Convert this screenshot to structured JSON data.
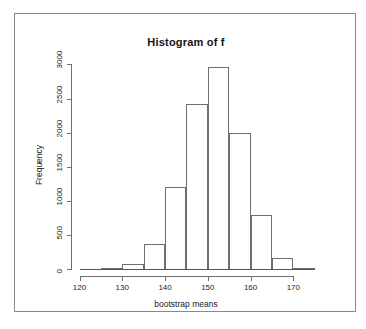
{
  "figure": {
    "title": "Histogram of f",
    "x_axis_title": "bootstrap means",
    "y_axis_title": "Frequency"
  },
  "chart_data": {
    "type": "bar",
    "title": "Histogram of f",
    "xlabel": "bootstrap means",
    "ylabel": "Frequency",
    "xlim": [
      118,
      176
    ],
    "ylim": [
      0,
      3050
    ],
    "grid": false,
    "legend": null,
    "bin_width": 5,
    "bin_edges": [
      120,
      125,
      130,
      135,
      140,
      145,
      150,
      155,
      160,
      165,
      170,
      175
    ],
    "categories": [
      "120-125",
      "125-130",
      "130-135",
      "135-140",
      "140-145",
      "145-150",
      "150-155",
      "155-160",
      "160-165",
      "165-170",
      "170-175"
    ],
    "values": [
      0,
      10,
      70,
      360,
      1200,
      2420,
      2960,
      2000,
      790,
      160,
      10
    ],
    "x_ticks": [
      120,
      130,
      140,
      150,
      160,
      170
    ],
    "x_tick_labels": [
      "120",
      "130",
      "140",
      "150",
      "160",
      "170"
    ],
    "y_ticks": [
      0,
      500,
      1000,
      1500,
      2000,
      2500,
      3000
    ],
    "y_tick_labels": [
      "0",
      "500",
      "1000",
      "1500",
      "2000",
      "2500",
      "3000"
    ],
    "bar_fill": "#ffffff",
    "bar_edge": "#6f6f6f",
    "axis_color": "#6d6d6d"
  }
}
